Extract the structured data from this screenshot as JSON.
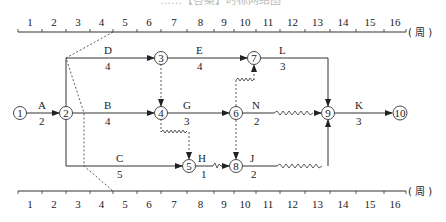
{
  "title_fragment": "……【答案】时标网络图",
  "axis": {
    "unit": "( 周 )",
    "ticks": [
      "1",
      "2",
      "3",
      "4",
      "5",
      "6",
      "7",
      "8",
      "9",
      "10",
      "11",
      "12",
      "13",
      "14",
      "15",
      "16"
    ]
  },
  "nodes": [
    {
      "id": "1",
      "x": 20,
      "y": 113
    },
    {
      "id": "2",
      "x": 66,
      "y": 113
    },
    {
      "id": "3",
      "x": 161,
      "y": 58
    },
    {
      "id": "4",
      "x": 161,
      "y": 113
    },
    {
      "id": "5",
      "x": 189,
      "y": 166
    },
    {
      "id": "6",
      "x": 236,
      "y": 113
    },
    {
      "id": "7",
      "x": 254,
      "y": 58
    },
    {
      "id": "8",
      "x": 236,
      "y": 166
    },
    {
      "id": "9",
      "x": 328,
      "y": 113
    },
    {
      "id": "10",
      "x": 400,
      "y": 113
    }
  ],
  "activities": [
    {
      "name": "A",
      "duration": "2",
      "from": "1",
      "to": "2"
    },
    {
      "name": "B",
      "duration": "4",
      "from": "2",
      "to": "4"
    },
    {
      "name": "C",
      "duration": "5",
      "from": "2",
      "to": "5"
    },
    {
      "name": "D",
      "duration": "4",
      "from": "2",
      "to": "3"
    },
    {
      "name": "E",
      "duration": "4",
      "from": "3",
      "to": "7"
    },
    {
      "name": "G",
      "duration": "3",
      "from": "4",
      "to": "6"
    },
    {
      "name": "H",
      "duration": "1",
      "from": "5",
      "to": "8"
    },
    {
      "name": "J",
      "duration": "2",
      "from": "8",
      "to": "9"
    },
    {
      "name": "L",
      "duration": "3",
      "from": "7",
      "to": "9"
    },
    {
      "name": "N",
      "duration": "2",
      "from": "6",
      "to": "9"
    },
    {
      "name": "K",
      "duration": "3",
      "from": "9",
      "to": "10"
    }
  ],
  "dummies": [
    {
      "from": "3",
      "to": "4"
    },
    {
      "from": "4",
      "to": "5"
    },
    {
      "from": "6",
      "to": "7"
    },
    {
      "from": "6",
      "to": "8"
    }
  ]
}
